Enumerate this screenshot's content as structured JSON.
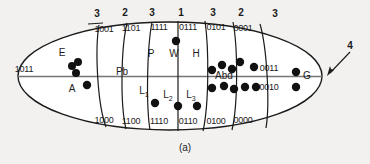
{
  "figure": {
    "caption": "(a)",
    "colors": {
      "background": "#f2f1ef",
      "outline": "#1b1b1b",
      "midline": "#6e6e6e",
      "dot": "#111111",
      "text": "#1b1b1b"
    },
    "segment_numbers": [
      {
        "id": "sn1",
        "label": "3",
        "x": 97,
        "y": 14
      },
      {
        "id": "sn2",
        "label": "2",
        "x": 125,
        "y": 13
      },
      {
        "id": "sn3",
        "label": "3",
        "x": 152,
        "y": 13
      },
      {
        "id": "sn4",
        "label": "1",
        "x": 181,
        "y": 13
      },
      {
        "id": "sn5",
        "label": "3",
        "x": 213,
        "y": 13
      },
      {
        "id": "sn6",
        "label": "2",
        "x": 241,
        "y": 13
      },
      {
        "id": "sn7",
        "label": "3",
        "x": 275,
        "y": 14
      }
    ],
    "top_codes": [
      {
        "id": "tc1",
        "label": "1001",
        "x": 104,
        "y": 29
      },
      {
        "id": "tc2",
        "label": "1101",
        "x": 131,
        "y": 28
      },
      {
        "id": "tc3",
        "label": "1111",
        "x": 159,
        "y": 27
      },
      {
        "id": "tc4",
        "label": "0111",
        "x": 188,
        "y": 27
      },
      {
        "id": "tc5",
        "label": "0101",
        "x": 216,
        "y": 27
      },
      {
        "id": "tc6",
        "label": "0001",
        "x": 243,
        "y": 28
      }
    ],
    "bottom_codes": [
      {
        "id": "bc1",
        "label": "1000",
        "x": 104,
        "y": 120
      },
      {
        "id": "bc2",
        "label": "1100",
        "x": 131,
        "y": 121
      },
      {
        "id": "bc3",
        "label": "1110",
        "x": 159,
        "y": 121
      },
      {
        "id": "bc4",
        "label": "0110",
        "x": 188,
        "y": 121
      },
      {
        "id": "bc5",
        "label": "0100",
        "x": 216,
        "y": 121
      },
      {
        "id": "bc6",
        "label": "0000",
        "x": 243,
        "y": 120
      }
    ],
    "side_codes": [
      {
        "id": "left-code",
        "label": "1011",
        "x": 24,
        "y": 69
      },
      {
        "id": "right-code-upper",
        "label": "0011",
        "x": 269,
        "y": 68
      },
      {
        "id": "right-code-lower",
        "label": "0010",
        "x": 269,
        "y": 87
      }
    ],
    "regions_upper": [
      {
        "id": "E",
        "label": "E",
        "x": 62,
        "y": 53
      },
      {
        "id": "Pb",
        "label": "Pb",
        "x": 122,
        "y": 72
      },
      {
        "id": "P",
        "label": "P",
        "x": 151,
        "y": 54
      },
      {
        "id": "W",
        "label": "W",
        "x": 174,
        "y": 54
      },
      {
        "id": "H",
        "label": "H",
        "x": 196,
        "y": 54
      },
      {
        "id": "Abd",
        "label": "Abd",
        "x": 224,
        "y": 76
      },
      {
        "id": "G",
        "label": "G",
        "x": 307,
        "y": 76
      }
    ],
    "regions_lower": [
      {
        "id": "A",
        "label": "A",
        "sub": "",
        "x": 72,
        "y": 89
      },
      {
        "id": "L1",
        "label": "L",
        "sub": "1",
        "x": 144,
        "y": 92
      },
      {
        "id": "L2",
        "label": "L",
        "sub": "2",
        "x": 168,
        "y": 96
      },
      {
        "id": "L3",
        "label": "L",
        "sub": "3",
        "x": 191,
        "y": 96
      }
    ],
    "arrow": {
      "id": "arrow-4",
      "label": "4",
      "label_x": 350,
      "label_y": 46
    },
    "dots": [
      {
        "group": "E",
        "x": 78,
        "y": 62,
        "r": 4.0
      },
      {
        "group": "E",
        "x": 72,
        "y": 66,
        "r": 4.0
      },
      {
        "group": "E",
        "x": 76,
        "y": 73,
        "r": 4.0
      },
      {
        "group": "E",
        "x": 87,
        "y": 85,
        "r": 4.2
      },
      {
        "group": "W",
        "x": 176,
        "y": 41,
        "r": 4.2
      },
      {
        "group": "L1",
        "x": 155,
        "y": 103,
        "r": 4.2
      },
      {
        "group": "L2",
        "x": 178,
        "y": 106,
        "r": 4.2
      },
      {
        "group": "L3",
        "x": 197,
        "y": 106,
        "r": 4.2
      },
      {
        "group": "Abd",
        "x": 212,
        "y": 70,
        "r": 4.2
      },
      {
        "group": "Abd",
        "x": 222,
        "y": 65,
        "r": 4.2
      },
      {
        "group": "Abd",
        "x": 232,
        "y": 69,
        "r": 4.2
      },
      {
        "group": "Abd",
        "x": 240,
        "y": 62,
        "r": 4.2
      },
      {
        "group": "Abd",
        "x": 254,
        "y": 67,
        "r": 4.2
      },
      {
        "group": "Abd",
        "x": 212,
        "y": 88,
        "r": 4.2
      },
      {
        "group": "Abd",
        "x": 224,
        "y": 86,
        "r": 4.2
      },
      {
        "group": "Abd",
        "x": 234,
        "y": 89,
        "r": 4.2
      },
      {
        "group": "Abd",
        "x": 245,
        "y": 87,
        "r": 4.2
      },
      {
        "group": "Abd",
        "x": 256,
        "y": 87,
        "r": 4.2
      },
      {
        "group": "G",
        "x": 296,
        "y": 72,
        "r": 4.2
      },
      {
        "group": "G",
        "x": 296,
        "y": 87,
        "r": 4.2
      }
    ],
    "boundaries": [
      {
        "id": "b1",
        "top_x": 99,
        "bottom_x": 106
      },
      {
        "id": "b2",
        "top_x": 127,
        "bottom_x": 126
      },
      {
        "id": "b3",
        "top_x": 152,
        "bottom_x": 150
      },
      {
        "id": "b4",
        "top_x": 178,
        "bottom_x": 178
      },
      {
        "id": "b5",
        "top_x": 205,
        "bottom_x": 203
      },
      {
        "id": "b6",
        "top_x": 233,
        "bottom_x": 232
      },
      {
        "id": "b7",
        "top_x": 260,
        "bottom_x": 266
      }
    ]
  }
}
